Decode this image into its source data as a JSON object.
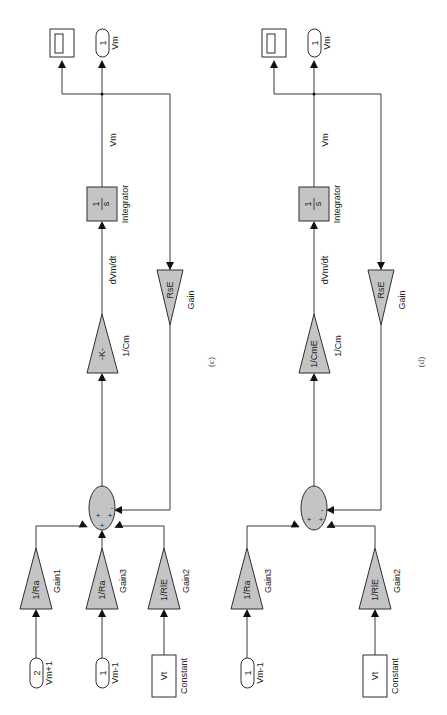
{
  "diagrams": [
    {
      "caption": "(c)",
      "outputs": {
        "scope_label": "",
        "outport_number": "1",
        "outport_name": "Vm"
      },
      "signal_vm": "Vm",
      "integrator": {
        "num": "1",
        "den": "s",
        "name": "Integrator"
      },
      "signal_dvmdt": "dVm/dt",
      "gain_cm": {
        "value": "-K-",
        "name": "1/Cm"
      },
      "gain_feedback": {
        "value": "RsE",
        "name": "Gain"
      },
      "sum_signs": [
        "+",
        "+",
        "+",
        "-"
      ],
      "inputs": [
        {
          "gain_value": "1/Ra",
          "gain_name": "Gain1",
          "source_type": "inport",
          "source_value": "2",
          "source_name": "Vm+1"
        },
        {
          "gain_value": "1/Ra",
          "gain_name": "Gain3",
          "source_type": "inport",
          "source_value": "1",
          "source_name": "Vm-1"
        },
        {
          "gain_value": "1/RlE",
          "gain_name": "Gain2",
          "source_type": "constant",
          "source_value": "Vt",
          "source_name": "Constant"
        }
      ]
    },
    {
      "caption": "(d)",
      "outputs": {
        "scope_label": "",
        "outport_number": "1",
        "outport_name": "Vm"
      },
      "signal_vm": "Vm",
      "integrator": {
        "num": "1",
        "den": "s",
        "name": "Integrator"
      },
      "signal_dvmdt": "dVm/dt",
      "gain_cm": {
        "value": "1/CmE",
        "name": "1/Cm"
      },
      "gain_feedback": {
        "value": "RsE",
        "name": "Gain"
      },
      "sum_signs": [
        "+",
        "+",
        "-"
      ],
      "inputs": [
        {
          "gain_value": "1/Ra",
          "gain_name": "Gain3",
          "source_type": "inport",
          "source_value": "1",
          "source_name": "Vm-1"
        },
        {
          "gain_value": "1/RlE",
          "gain_name": "Gain2",
          "source_type": "constant",
          "source_value": "Vt",
          "source_name": "Constant"
        }
      ]
    }
  ],
  "colors": {
    "block_fill": "#c4c4c4",
    "line": "#3a3a3a",
    "background": "#ffffff"
  }
}
